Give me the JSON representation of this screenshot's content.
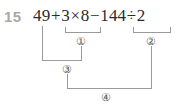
{
  "problem": {
    "number": "15",
    "expression_text": "49+3×8−144÷2",
    "terms": {
      "t1": "49",
      "op1": "+",
      "t2": "3",
      "op2": "×",
      "t3": "8",
      "op3": "−",
      "t4": "144",
      "op4": "÷",
      "t5": "2"
    }
  },
  "steps": [
    {
      "id": "step-1",
      "label": "①",
      "covers": "3×8"
    },
    {
      "id": "step-2",
      "label": "②",
      "covers": "144÷2"
    },
    {
      "id": "step-3",
      "label": "③",
      "covers": "49+①"
    },
    {
      "id": "step-4",
      "label": "④",
      "covers": "③−②"
    }
  ],
  "colors": {
    "page_background": "#ffffff",
    "expression_text": "#2b2b2b",
    "problem_number": "#a8a8a8",
    "bracket_line": "#9a9a9a",
    "step_label": "#555555"
  }
}
